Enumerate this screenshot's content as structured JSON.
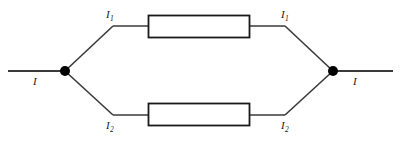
{
  "figure": {
    "type": "circuit-diagram",
    "background_color": "#ffffff",
    "wire_color": "#3a3a3a",
    "resistor_border_color": "#1a1a1a",
    "resistor_fill_color": "#ffffff",
    "node_color": "#000000"
  },
  "labels": {
    "input_current": {
      "symbol": "I",
      "subscript": ""
    },
    "output_current": {
      "symbol": "I",
      "subscript": ""
    },
    "branch1_left": {
      "symbol": "I",
      "subscript": "1"
    },
    "branch1_right": {
      "symbol": "I",
      "subscript": "1"
    },
    "branch2_left": {
      "symbol": "I",
      "subscript": "2"
    },
    "branch2_right": {
      "symbol": "I",
      "subscript": "2"
    }
  },
  "geometry": {
    "canvas": {
      "width": 401,
      "height": 145
    },
    "left_node": {
      "x": 65,
      "y": 71,
      "r": 5
    },
    "right_node": {
      "x": 333,
      "y": 71,
      "r": 5
    },
    "left_lead": {
      "x1": 8,
      "y1": 71,
      "x2": 65,
      "y2": 71
    },
    "right_lead": {
      "x1": 333,
      "y1": 71,
      "x2": 393,
      "y2": 71
    },
    "upper_branch_y": 26,
    "lower_branch_y": 115,
    "upper_vertex_left_x": 113,
    "upper_vertex_right_x": 285,
    "lower_vertex_left_x": 113,
    "lower_vertex_right_x": 285,
    "resistor_upper": {
      "x": 148,
      "y": 15,
      "width": 102,
      "height": 23
    },
    "resistor_lower": {
      "x": 148,
      "y": 103,
      "width": 102,
      "height": 23
    }
  }
}
